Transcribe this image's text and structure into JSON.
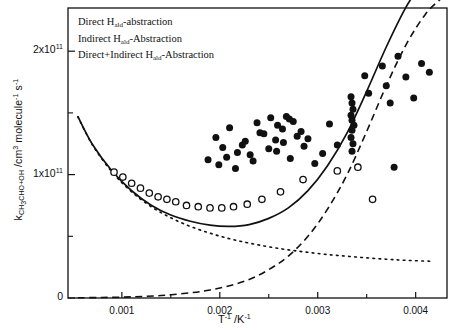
{
  "chart_data": {
    "type": "scatter",
    "title": "",
    "xlabel": "T-1 /K-1",
    "ylabel": "kCH3CHO+OH /cm3 molecule-1 s-1",
    "xlim": [
      0.00045,
      0.00432
    ],
    "ylim": [
      0,
      235000000000.0
    ],
    "xticks": [
      0.001,
      0.002,
      0.003,
      0.004
    ],
    "xtick_labels": [
      "0.001",
      "0.002",
      "0.003",
      "0.004"
    ],
    "yticks": [
      0,
      100000000000.0,
      200000000000.0
    ],
    "ytick_labels": [
      "0",
      "1x1011",
      "2x1011"
    ],
    "yminorticks": [
      50000000000.0,
      150000000000.0
    ],
    "grid": false,
    "legend_position": "top-left",
    "series": [
      {
        "name": "Direct Hald-abstraction",
        "style": "dotted",
        "type": "line",
        "x": [
          0.00055,
          0.0007,
          0.0009,
          0.0011,
          0.0013,
          0.0015,
          0.0017,
          0.0019,
          0.0021,
          0.0023,
          0.0025,
          0.0027,
          0.0029,
          0.0031,
          0.0033,
          0.0035,
          0.0037,
          0.0039,
          0.00415
        ],
        "y": [
          147000000000.0,
          124000000000.0,
          102000000000.0,
          86000000000.0,
          74000000000.0,
          65000000000.0,
          58000000000.0,
          52500000000.0,
          48000000000.0,
          44500000000.0,
          41500000000.0,
          39000000000.0,
          37000000000.0,
          35200000000.0,
          33800000000.0,
          32500000000.0,
          31400000000.0,
          30500000000.0,
          29800000000.0
        ]
      },
      {
        "name": "Indirect Hald-Abstraction",
        "style": "dashed",
        "type": "line",
        "x": [
          0.00055,
          0.0008,
          0.0011,
          0.0014,
          0.0017,
          0.0019,
          0.0021,
          0.0023,
          0.0025,
          0.0027,
          0.0029,
          0.0031,
          0.0033,
          0.0035,
          0.0037,
          0.0039,
          0.0041,
          0.00425
        ],
        "y": [
          200000000.0,
          400000000.0,
          900000000.0,
          2000000000.0,
          4200000000.0,
          6500000000.0,
          10000000000.0,
          15000000000.0,
          23000000000.0,
          34000000000.0,
          50000000000.0,
          72000000000.0,
          100000000000.0,
          135000000000.0,
          172000000000.0,
          205000000000.0,
          230000000000.0,
          242000000000.0
        ]
      },
      {
        "name": "Direct+Indirect Hald-Abstraction",
        "style": "solid",
        "type": "line",
        "x": [
          0.00055,
          0.0007,
          0.0009,
          0.0011,
          0.0013,
          0.0015,
          0.0017,
          0.0019,
          0.0021,
          0.0023,
          0.0025,
          0.0027,
          0.0029,
          0.0031,
          0.0033,
          0.0035,
          0.0037,
          0.0039,
          0.0041,
          0.00425
        ],
        "y": [
          147200000000.0,
          124400000000.0,
          102900000000.0,
          86900000000.0,
          75200000000.0,
          67200000000.0,
          62200000000.0,
          59000000000.0,
          58000000000.0,
          59500000000.0,
          64500000000.0,
          73000000000.0,
          87000000000.0,
          107200000000.0,
          133800000000.0,
          167500000000.0,
          203400000000.0,
          235500000000.0,
          260000000000.0,
          272000000000.0
        ]
      },
      {
        "name": "filled-circles",
        "style": "filled-circle",
        "type": "scatter",
        "x": [
          0.00196,
          0.00203,
          0.00188,
          0.0021,
          0.00218,
          0.00226,
          0.00234,
          0.00241,
          0.00199,
          0.00207,
          0.00216,
          0.00223,
          0.00231,
          0.00238,
          0.00245,
          0.00252,
          0.00259,
          0.0025,
          0.00257,
          0.00264,
          0.00271,
          0.00258,
          0.00265,
          0.00272,
          0.00279,
          0.00286,
          0.00268,
          0.00275,
          0.00283,
          0.0029,
          0.00297,
          0.00305,
          0.00312,
          0.0032,
          0.00334,
          0.00335,
          0.00336,
          0.00334,
          0.00335,
          0.00337,
          0.00335,
          0.00334,
          0.00336,
          0.00335,
          0.00348,
          0.00352,
          0.00366,
          0.0037,
          0.00374,
          0.00382,
          0.0039,
          0.00398,
          0.00406,
          0.00414,
          0.00378
        ],
        "y": [
          130000000000.0,
          122000000000.0,
          112000000000.0,
          138000000000.0,
          118000000000.0,
          127000000000.0,
          111000000000.0,
          134000000000.0,
          108000000000.0,
          114000000000.0,
          105000000000.0,
          124000000000.0,
          116000000000.0,
          142000000000.0,
          133000000000.0,
          146000000000.0,
          140000000000.0,
          121000000000.0,
          128000000000.0,
          137000000000.0,
          145000000000.0,
          119000000000.0,
          126000000000.0,
          113000000000.0,
          131000000000.0,
          123000000000.0,
          147000000000.0,
          143000000000.0,
          135000000000.0,
          129000000000.0,
          109000000000.0,
          117000000000.0,
          141000000000.0,
          124000000000.0,
          163000000000.0,
          158000000000.0,
          153000000000.0,
          148000000000.0,
          144000000000.0,
          140000000000.0,
          136000000000.0,
          130000000000.0,
          125000000000.0,
          119000000000.0,
          180000000000.0,
          166000000000.0,
          188000000000.0,
          172000000000.0,
          158000000000.0,
          196000000000.0,
          179000000000.0,
          162000000000.0,
          190000000000.0,
          183000000000.0,
          106000000000.0
        ]
      },
      {
        "name": "open-circles",
        "style": "open-circle",
        "type": "scatter",
        "x": [
          0.00092,
          0.00101,
          0.0011,
          0.00119,
          0.00128,
          0.00137,
          0.00146,
          0.00155,
          0.00166,
          0.00178,
          0.0019,
          0.00202,
          0.00214,
          0.00228,
          0.00243,
          0.00262,
          0.00285,
          0.0032,
          0.00341,
          0.00356
        ],
        "y": [
          102000000000.0,
          98000000000.0,
          93000000000.0,
          89000000000.0,
          85000000000.0,
          82000000000.0,
          80000000000.0,
          78000000000.0,
          75000000000.0,
          74000000000.0,
          73000000000.0,
          73000000000.0,
          74000000000.0,
          76000000000.0,
          80000000000.0,
          86000000000.0,
          96000000000.0,
          103000000000.0,
          106000000000.0,
          80000000000.0
        ]
      }
    ]
  },
  "legend": {
    "items": [
      {
        "label_pre": "Direct H",
        "label_sub": "ald",
        "label_post": "-abstraction",
        "key": "dotted"
      },
      {
        "label_pre": "Indirect H",
        "label_sub": "ald",
        "label_post": "-Abstraction",
        "key": "dashed"
      },
      {
        "label_pre": "Direct+Indirect H",
        "label_sub": "ald",
        "label_post": "-Abstraction",
        "key": "solid"
      }
    ]
  },
  "axes": {
    "y_label_parts": {
      "k": "k",
      "k_sub": "CH3CHO+OH",
      "rest": " /cm",
      "cm_sup": "3",
      "mol": " molecule",
      "mol_sup": "-1",
      "s": " s",
      "s_sup": "-1"
    },
    "x_label_parts": {
      "t": "T",
      "t_sup": "-1",
      "mid": " /K",
      "k_sup": "-1"
    },
    "ytick_labels": [
      {
        "text": "0",
        "mant": "",
        "exp": ""
      },
      {
        "text": "1x10",
        "mant": "1x10",
        "exp": "11"
      },
      {
        "text": "2x10",
        "mant": "2x10",
        "exp": "11"
      }
    ],
    "xtick_labels": [
      "0.001",
      "0.002",
      "0.003",
      "0.004"
    ]
  },
  "colors": {
    "ink": "#111111",
    "background": "#ffffff"
  }
}
